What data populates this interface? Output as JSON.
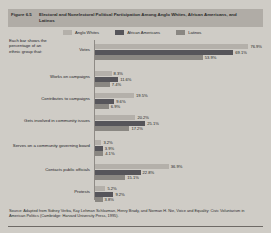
{
  "figure": {
    "number": "Figure 6.5",
    "title_line1": "Electoral and Nonelectoral Political Participation Among Anglo Whites, African Americans, and",
    "title_line2": "Latinos"
  },
  "caption": "Each bar shows the percentage of an ethnic group that:",
  "source": "Source: Adapted from Sidney Verba, Kay Lehman Schlozman, Henry Brady, and Norman H. Nie, Voice and Equality: Civic Voluntarism in American Politics (Cambridge: Harvard University Press, 1995).",
  "colors": {
    "anglo_whites": "#b4b0aa",
    "african_americans": "#56555a",
    "latinos": "#8a8782",
    "panel_bg": "#cfccc6",
    "title_bg": "#b0aca6"
  },
  "chart_data": {
    "type": "bar",
    "orientation": "horizontal",
    "title": "Electoral and Nonelectoral Political Participation Among Anglo Whites, African Americans, and Latinos",
    "xlabel": "",
    "ylabel": "",
    "xlim": [
      0,
      80
    ],
    "grid": false,
    "legend_position": "top",
    "value_suffix": "%",
    "categories": [
      "Votes",
      "Works on campaigns",
      "Contributes to campaigns",
      "Gets involved in community issues",
      "Serves on a community governing board",
      "Contacts public officials",
      "Protests"
    ],
    "series": [
      {
        "name": "Anglo Whites",
        "color": "#b4b0aa",
        "values": [
          76.9,
          8.3,
          19.5,
          20.2,
          3.2,
          36.9,
          5.2
        ]
      },
      {
        "name": "African Americans",
        "color": "#56555a",
        "values": [
          69.1,
          11.6,
          9.6,
          25.1,
          3.9,
          22.8,
          9.2
        ]
      },
      {
        "name": "Latinos",
        "color": "#8a8782",
        "values": [
          53.9,
          7.4,
          6.9,
          17.2,
          4.1,
          15.1,
          3.8
        ]
      }
    ],
    "labels": {
      "Votes": [
        "76.9%",
        "69.1%",
        "53.9%"
      ],
      "Works on campaigns": [
        "8.3%",
        "11.6%",
        "7.4%"
      ],
      "Contributes to campaigns": [
        "19.5%",
        "9.6%",
        "6.9%"
      ],
      "Gets involved in community issues": [
        "20.2%",
        "25.1%",
        "17.2%"
      ],
      "Serves on a community governing board": [
        "3.2%",
        "3.9%",
        "4.1%"
      ],
      "Contacts public officials": [
        "36.9%",
        "22.8%",
        "15.1%"
      ],
      "Protests": [
        "5.2%",
        "9.2%",
        "3.8%"
      ]
    }
  }
}
